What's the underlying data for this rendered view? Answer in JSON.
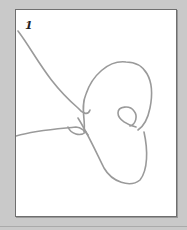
{
  "figure": {
    "step_number": "1",
    "colors": {
      "background": "#c9c9c9",
      "panel": "#ffffff",
      "border": "#6f6f6f",
      "cord": "#9a9a9a"
    }
  }
}
